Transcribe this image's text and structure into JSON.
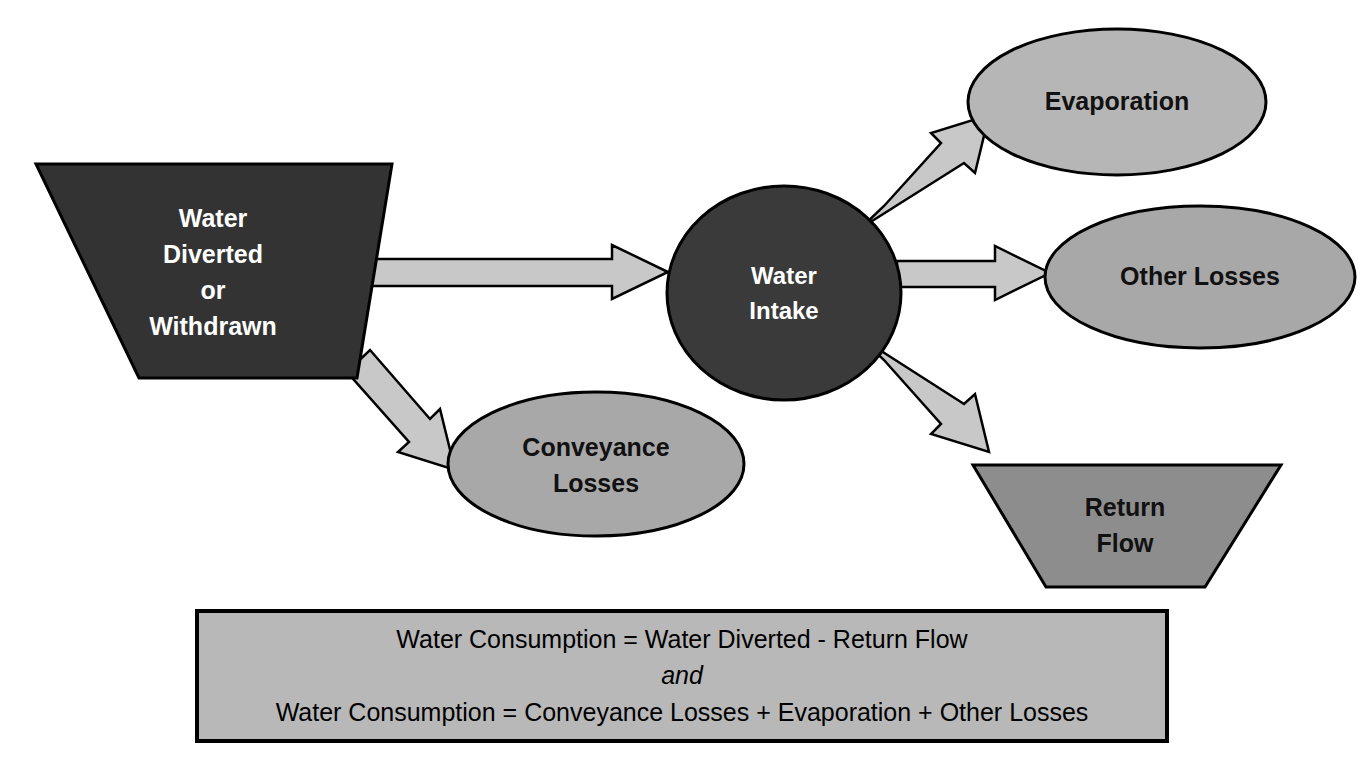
{
  "diagram": {
    "background_color": "#ffffff",
    "nodes": {
      "water_diverted": {
        "label_lines": [
          "Water",
          "Diverted",
          "or",
          "Withdrawn"
        ],
        "shape": "trapezoid",
        "fill": "#333333",
        "stroke": "#000000",
        "text_color": "#ffffff"
      },
      "water_intake": {
        "label_lines": [
          "Water",
          "Intake"
        ],
        "shape": "circle",
        "fill": "#3a3a3a",
        "stroke": "#000000",
        "text_color": "#ffffff"
      },
      "evaporation": {
        "label_lines": [
          "Evaporation"
        ],
        "shape": "ellipse",
        "fill": "#b6b6b6",
        "stroke": "#000000",
        "text_color": "#111111"
      },
      "other_losses": {
        "label_lines": [
          "Other Losses"
        ],
        "shape": "ellipse",
        "fill": "#a8a8a8",
        "stroke": "#000000",
        "text_color": "#111111"
      },
      "conveyance_losses": {
        "label_lines": [
          "Conveyance",
          "Losses"
        ],
        "shape": "ellipse",
        "fill": "#a8a8a8",
        "stroke": "#000000",
        "text_color": "#111111"
      },
      "return_flow": {
        "label_lines": [
          "Return",
          "Flow"
        ],
        "shape": "trapezoid",
        "fill": "#8d8d8d",
        "stroke": "#000000",
        "text_color": "#111111"
      }
    },
    "arrows": [
      {
        "name": "diverted-to-intake",
        "from": "water_diverted",
        "to": "water_intake",
        "direction": "right",
        "fill": "#c8c8c8",
        "stroke": "#000000"
      },
      {
        "name": "diverted-to-conveyance",
        "from": "water_diverted",
        "to": "conveyance_losses",
        "direction": "down-right",
        "fill": "#c8c8c8",
        "stroke": "#000000"
      },
      {
        "name": "intake-to-evaporation",
        "from": "water_intake",
        "to": "evaporation",
        "direction": "up-right",
        "fill": "#c8c8c8",
        "stroke": "#000000"
      },
      {
        "name": "intake-to-other-losses",
        "from": "water_intake",
        "to": "other_losses",
        "direction": "right",
        "fill": "#c8c8c8",
        "stroke": "#000000"
      },
      {
        "name": "intake-to-return-flow",
        "from": "water_intake",
        "to": "return_flow",
        "direction": "down-right",
        "fill": "#c8c8c8",
        "stroke": "#000000"
      }
    ],
    "equation_box": {
      "fill": "#b8b8b8",
      "stroke": "#000000",
      "line1": "Water Consumption  =  Water Diverted - Return Flow",
      "line2": "and",
      "line3": "Water Consumption  =  Conveyance Losses + Evaporation + Other Losses"
    }
  }
}
